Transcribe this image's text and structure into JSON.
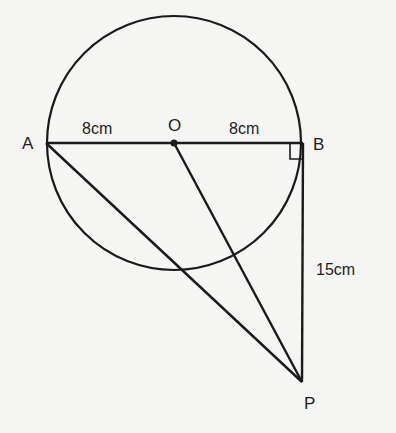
{
  "diagram": {
    "title": "",
    "points": {
      "A": {
        "label": "A",
        "x": 46,
        "y": 143
      },
      "O": {
        "label": "O",
        "x": 174,
        "y": 143
      },
      "B": {
        "label": "B",
        "x": 303,
        "y": 143
      },
      "P": {
        "label": "P",
        "x": 302,
        "y": 382
      }
    },
    "circle": {
      "center": "O",
      "cx": 174,
      "cy": 143,
      "r": 127
    },
    "segments": [
      {
        "from": "A",
        "to": "B",
        "label": ""
      },
      {
        "from": "B",
        "to": "P",
        "label": "15cm"
      },
      {
        "from": "A",
        "to": "P",
        "label": ""
      },
      {
        "from": "O",
        "to": "P",
        "label": ""
      }
    ],
    "labels": {
      "A": "A",
      "O": "O",
      "B": "B",
      "P": "P",
      "AO_length": "8cm",
      "OB_length": "8cm",
      "BP_length": "15cm"
    },
    "right_angle_at": "B",
    "stroke_color": "#1a1a1a",
    "background_color": "#f5f5f3"
  }
}
